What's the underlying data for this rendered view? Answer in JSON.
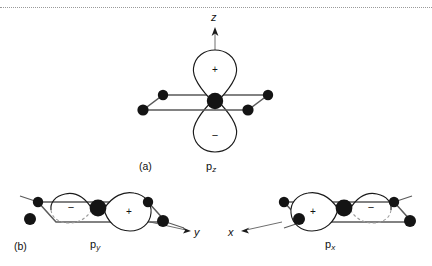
{
  "figure": {
    "background_color": "#ffffff",
    "ink_color": "#111111",
    "atom_color": "#141414",
    "bond_color": "#4a4a4a",
    "orbital_line_color": "#1a1a1a",
    "dotted_rule_color": "#9a9a9a"
  },
  "panels": [
    {
      "tag": "(a)",
      "orbital_label_base": "p",
      "orbital_label_sub": "z",
      "axis_label": "z",
      "axis_direction": "up",
      "lobes": [
        {
          "sign": "+",
          "position": "above-plane"
        },
        {
          "sign": "−",
          "position": "below-plane"
        }
      ],
      "ligand_count": 4,
      "geometry": "square-planar"
    },
    {
      "tag": "(b)",
      "orbital_label_base": "p",
      "orbital_label_sub": "y",
      "axis_label": "y",
      "axis_direction": "right",
      "lobes": [
        {
          "sign": "−",
          "position": "left-in-plane"
        },
        {
          "sign": "+",
          "position": "right-in-plane"
        }
      ],
      "ligand_count": 4,
      "geometry": "square-planar"
    },
    {
      "tag": "",
      "orbital_label_base": "p",
      "orbital_label_sub": "x",
      "axis_label": "x",
      "axis_direction": "left",
      "lobes": [
        {
          "sign": "+",
          "position": "left-in-plane"
        },
        {
          "sign": "−",
          "position": "right-in-plane"
        }
      ],
      "ligand_count": 4,
      "geometry": "square-planar"
    }
  ],
  "labels": {
    "axis_z": "z",
    "axis_y": "y",
    "axis_x": "x",
    "tag_a": "(a)",
    "tag_b": "(b)",
    "p_base": "p",
    "sub_z": "z",
    "sub_y": "y",
    "sub_x": "x",
    "sign_plus": "+",
    "sign_minus": "−"
  }
}
